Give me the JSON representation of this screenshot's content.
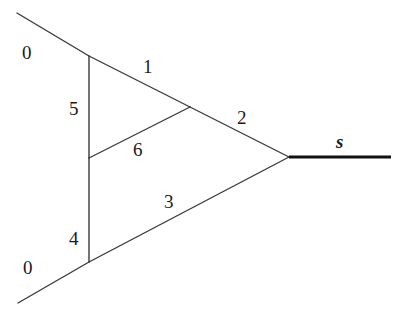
{
  "diagram": {
    "type": "graph",
    "edges": [
      {
        "id": "top-outer",
        "x1": 17,
        "y1": 13,
        "x2": 89,
        "y2": 56
      },
      {
        "id": "edge-1",
        "x1": 89,
        "y1": 56,
        "x2": 190,
        "y2": 107
      },
      {
        "id": "edge-2",
        "x1": 190,
        "y1": 107,
        "x2": 289,
        "y2": 157
      },
      {
        "id": "edge-5",
        "x1": 89,
        "y1": 56,
        "x2": 89,
        "y2": 158
      },
      {
        "id": "edge-4",
        "x1": 89,
        "y1": 158,
        "x2": 89,
        "y2": 262
      },
      {
        "id": "edge-6",
        "x1": 89,
        "y1": 158,
        "x2": 190,
        "y2": 107
      },
      {
        "id": "edge-3",
        "x1": 89,
        "y1": 262,
        "x2": 289,
        "y2": 157
      },
      {
        "id": "bottom-outer",
        "x1": 18,
        "y1": 303,
        "x2": 89,
        "y2": 262
      }
    ],
    "thick_edge": {
      "id": "edge-s",
      "x1": 289,
      "y1": 157,
      "x2": 391,
      "y2": 157
    },
    "labels": {
      "top_zero": "0",
      "bottom_zero": "0",
      "one": "1",
      "two": "2",
      "three": "3",
      "four": "4",
      "five": "5",
      "six": "6",
      "s": "s"
    }
  }
}
